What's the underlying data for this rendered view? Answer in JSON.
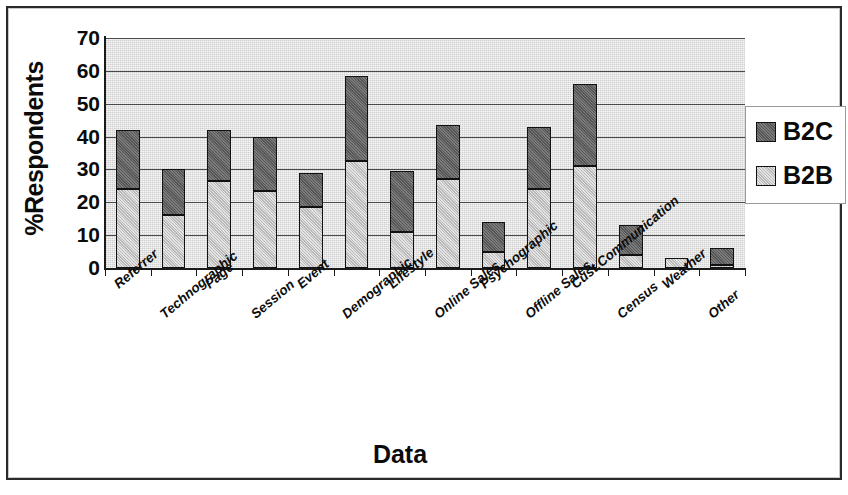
{
  "chart_data": {
    "type": "bar",
    "subtype": "stacked-vertical",
    "title": "",
    "xlabel": "Data",
    "ylabel": "%Respondents",
    "ylim": [
      0,
      70
    ],
    "ytick_labels": [
      "0",
      "10",
      "20",
      "30",
      "40",
      "50",
      "60",
      "70"
    ],
    "ytick_values": [
      0,
      10,
      20,
      30,
      40,
      50,
      60,
      70
    ],
    "grid": true,
    "grid_axis": "y",
    "legend_position": "right",
    "categories": [
      "Referrer",
      "Technographic",
      "Page",
      "Session",
      "Event",
      "Demographic",
      "Lifestyle",
      "Online Sales",
      "Psychographic",
      "Offline Sales",
      "Cust.Communication",
      "Census",
      "Weather",
      "Other"
    ],
    "series": [
      {
        "name": "B2B",
        "color": "#b9b9b9",
        "values": [
          24,
          16,
          26.5,
          23.5,
          18.5,
          32.5,
          11,
          27,
          5,
          24,
          31,
          4,
          3,
          1
        ]
      },
      {
        "name": "B2C",
        "color": "#565656",
        "values": [
          18,
          14,
          15.5,
          16.5,
          10.5,
          26,
          18.5,
          16.5,
          9,
          19,
          25,
          9,
          0,
          5
        ]
      }
    ],
    "totals": [
      42,
      30,
      42,
      40,
      29,
      58.5,
      29.5,
      43.5,
      14,
      43,
      56,
      13,
      3,
      6
    ]
  },
  "legend": {
    "entries": [
      {
        "label": "B2C",
        "swatch": "b2c-swatch"
      },
      {
        "label": "B2B",
        "swatch": "b2b-swatch"
      }
    ]
  },
  "axes": {
    "y_title": "%Respondents",
    "x_title": "Data"
  }
}
